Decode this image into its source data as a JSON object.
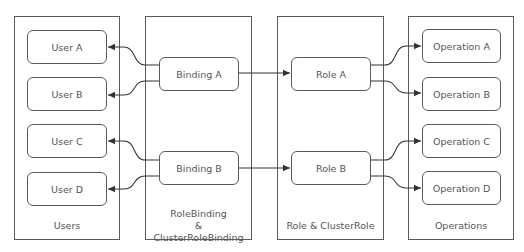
{
  "diagram": {
    "columns": [
      {
        "id": "users",
        "label": "Users",
        "nodes": [
          "User A",
          "User B",
          "User C",
          "User D"
        ]
      },
      {
        "id": "bindings",
        "label_lines": [
          "RoleBinding",
          "&",
          "ClusterRoleBinding"
        ],
        "nodes": [
          "Binding A",
          "Binding B"
        ]
      },
      {
        "id": "roles",
        "label": "Role & ClusterRole",
        "nodes": [
          "Role A",
          "Role B"
        ]
      },
      {
        "id": "operations",
        "label": "Operations",
        "nodes": [
          "Operation A",
          "Operation B",
          "Operation C",
          "Operation D"
        ]
      }
    ],
    "edges": [
      {
        "from": "Binding A",
        "to": "User A"
      },
      {
        "from": "Binding A",
        "to": "User B"
      },
      {
        "from": "Binding B",
        "to": "User C"
      },
      {
        "from": "Binding B",
        "to": "User D"
      },
      {
        "from": "Binding A",
        "to": "Role A"
      },
      {
        "from": "Binding B",
        "to": "Role B"
      },
      {
        "from": "Role A",
        "to": "Operation A"
      },
      {
        "from": "Role A",
        "to": "Operation B"
      },
      {
        "from": "Role B",
        "to": "Operation C"
      },
      {
        "from": "Role B",
        "to": "Operation D"
      }
    ],
    "colors": {
      "stroke": "#5a5a5a",
      "text": "#555555",
      "background": "#ffffff"
    }
  }
}
